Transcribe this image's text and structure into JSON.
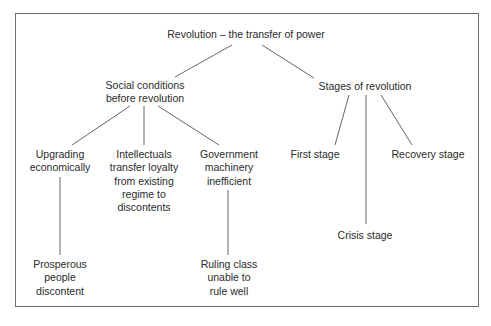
{
  "diagram": {
    "type": "tree",
    "root": "Revolution – the transfer of power",
    "branches": [
      {
        "label_lines": [
          "Social conditions",
          "before revolution"
        ],
        "children": [
          {
            "label_lines": [
              "Upgrading",
              "economically"
            ],
            "children": [
              {
                "label_lines": [
                  "Prosperous",
                  "people",
                  "discontent"
                ]
              }
            ]
          },
          {
            "label_lines": [
              "Intellectuals",
              "transfer loyalty",
              "from existing",
              "regime to",
              "discontents"
            ]
          },
          {
            "label_lines": [
              "Government",
              "machinery",
              "inefficient"
            ],
            "children": [
              {
                "label_lines": [
                  "Ruling class",
                  "unable to",
                  "rule well"
                ]
              }
            ]
          }
        ]
      },
      {
        "label_lines": [
          "Stages of revolution"
        ],
        "children": [
          {
            "label_lines": [
              "First stage"
            ]
          },
          {
            "label_lines": [
              "Crisis stage"
            ]
          },
          {
            "label_lines": [
              "Recovery stage"
            ]
          }
        ]
      }
    ]
  },
  "nodes": {
    "root": "Revolution – the transfer of power",
    "social": [
      "Social conditions",
      "before revolution"
    ],
    "stages": "Stages of revolution",
    "upgrading": [
      "Upgrading",
      "economically"
    ],
    "intellectuals": [
      "Intellectuals",
      "transfer loyalty",
      "from existing",
      "regime to",
      "discontents"
    ],
    "government": [
      "Government",
      "machinery",
      "inefficient"
    ],
    "prosperous": [
      "Prosperous",
      "people",
      "discontent"
    ],
    "ruling": [
      "Ruling class",
      "unable to",
      "rule well"
    ],
    "first": "First stage",
    "crisis": "Crisis stage",
    "recovery": "Recovery stage"
  },
  "colors": {
    "line": "#555555",
    "text": "#2a2a2a",
    "frame": "#6f6f6f"
  }
}
